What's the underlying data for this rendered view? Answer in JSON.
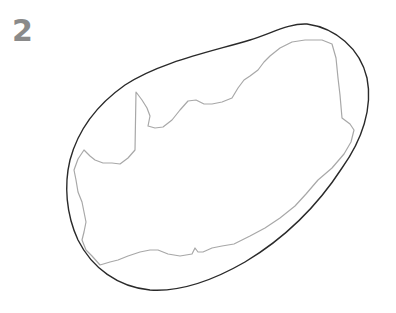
{
  "figure": {
    "label": "2",
    "colors": {
      "background": "#ffffff",
      "outer_stroke": "#2a2a2a",
      "inner_stroke": "#a8a8a8",
      "label": "#8a8a8a"
    }
  }
}
